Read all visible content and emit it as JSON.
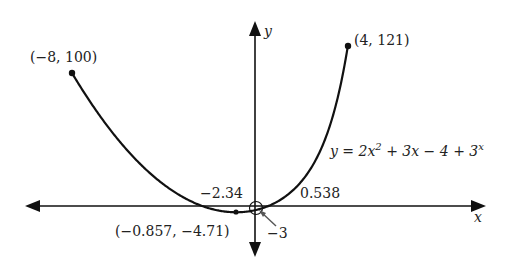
{
  "chart_data": {
    "type": "line",
    "title": "",
    "function_label": "y = 2x² + 3x − 4 + 3ˣ",
    "equation": {
      "prefix": "y = 2x",
      "sup1": "2",
      "middle": " + 3x − 4 + 3",
      "sup2": "x"
    },
    "xlabel": "x",
    "ylabel": "y",
    "xlim": [
      -8,
      4
    ],
    "ylim": [
      -4.71,
      121
    ],
    "grid": false,
    "legend": null,
    "series": [
      {
        "name": "y = 2x^2 + 3x - 4 + 3^x",
        "x": [
          -8,
          -7,
          -6,
          -5,
          -4,
          -3,
          -2,
          -1,
          -0.857,
          0,
          0.538,
          1,
          2,
          3,
          4
        ],
        "values": [
          100.0,
          73.0,
          50.0,
          31.0,
          16.0,
          5.04,
          -1.89,
          -4.67,
          -4.71,
          -3.0,
          0.0,
          4.0,
          19.0,
          44.0,
          121.0
        ]
      }
    ],
    "annotations": [
      {
        "label": "(−8, 100)",
        "x": -8,
        "y": 100,
        "kind": "endpoint"
      },
      {
        "label": "(4, 121)",
        "x": 4,
        "y": 121,
        "kind": "endpoint"
      },
      {
        "label": "(−0.857, −4.71)",
        "x": -0.857,
        "y": -4.71,
        "kind": "minimum"
      },
      {
        "label": "−2.34",
        "x": -2.34,
        "y": 0,
        "kind": "x-intercept"
      },
      {
        "label": "0.538",
        "x": 0.538,
        "y": 0,
        "kind": "x-intercept"
      },
      {
        "label": "−3",
        "x": 0,
        "y": -3,
        "kind": "y-intercept"
      }
    ]
  },
  "labels": {
    "axis_x": "x",
    "axis_y": "y",
    "endpoint_left": "(−8, 100)",
    "endpoint_right": "(4, 121)",
    "minimum": "(−0.857, −4.71)",
    "x_intercept_left": "−2.34",
    "x_intercept_right": "0.538",
    "y_intercept": "−3"
  }
}
